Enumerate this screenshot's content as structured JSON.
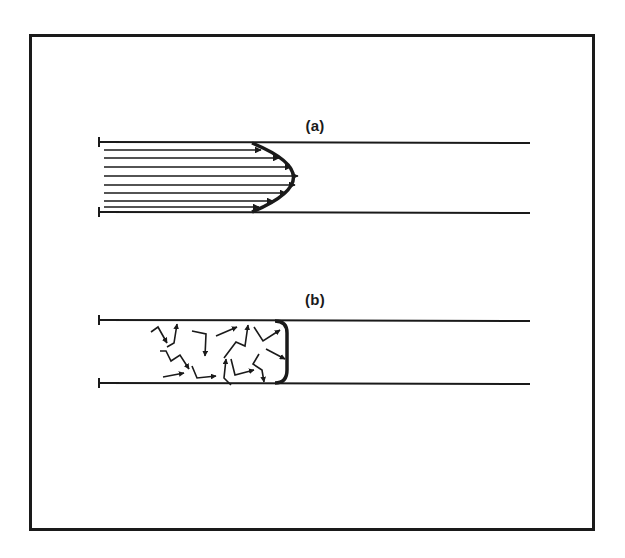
{
  "figure": {
    "frame": {
      "border_color": "#1a1a1a",
      "background": "#ffffff"
    },
    "panels": [
      {
        "id": "a",
        "label": "(a)",
        "description": "laminar flow: parallel streamlines with parabolic velocity profile",
        "pipe": {
          "x_start": 99,
          "x_end": 530,
          "y_top": 142,
          "y_bottom": 212
        },
        "profile": {
          "shape": "parabolic",
          "start_x": 252,
          "vertex_x": 303,
          "vertex_y": 177
        },
        "streamline_count": 8
      },
      {
        "id": "b",
        "label": "(b)",
        "description": "turbulent flow: random zigzag arrows with blunt (flat) velocity profile",
        "pipe": {
          "x_start": 99,
          "x_end": 530,
          "y_top": 320,
          "y_bottom": 383
        },
        "profile": {
          "shape": "blunt",
          "front_x": 287
        },
        "eddy_arrow_count": 13
      }
    ],
    "colors": {
      "ink": "#1a1a1a"
    }
  }
}
